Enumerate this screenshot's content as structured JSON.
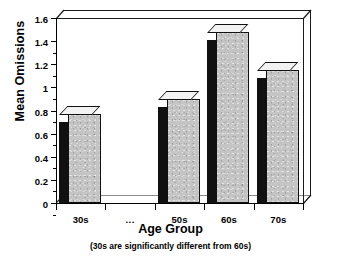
{
  "chart_data": {
    "type": "bar",
    "title": "",
    "subtitle": "",
    "xlabel": "Age Group",
    "ylabel": "Mean Omissions",
    "note": "(30s are significantly different from 60s)",
    "categories": [
      "30s",
      "...",
      "50s",
      "60s",
      "70s"
    ],
    "values": [
      0.77,
      null,
      0.9,
      1.48,
      1.15
    ],
    "ylim": [
      0,
      1.6
    ],
    "ytick_values": [
      0,
      0.2,
      0.4,
      0.6,
      0.8,
      1,
      1.2,
      1.4,
      1.6
    ],
    "ytick_labels": [
      "0",
      "0.2",
      "0.4",
      "0.6",
      "0.8",
      "1",
      "1.2",
      "1.4",
      "1.6"
    ],
    "grid": false,
    "legend": false,
    "style": "3d-bar",
    "colors": {
      "bar_face": "#c4c4c4",
      "bar_side": "#111111",
      "bar_top": "#f2f2f2",
      "axis": "#000000",
      "background": "#ffffff"
    }
  },
  "axes": {
    "y_title": "Mean Omissions",
    "x_title": "Age Group",
    "footnote": "(30s are significantly different from 60s)"
  }
}
